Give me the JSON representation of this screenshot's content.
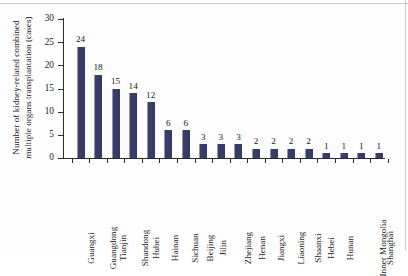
{
  "chart_data": {
    "type": "bar",
    "title": "",
    "xlabel": "",
    "ylabel": "Number of kidney-related combined multiple organs transplantation (cases)",
    "ylabel_line1": "Number of kidney-related combined",
    "ylabel_line2": "multiple organs transplantation (cases)",
    "ylim": [
      0,
      30
    ],
    "yticks": [
      0,
      5,
      10,
      15,
      20,
      25,
      30
    ],
    "ytick_labels": [
      "0",
      "5",
      "10",
      "15",
      "20",
      "25",
      "30"
    ],
    "grid": false,
    "legend": false,
    "bar_color": "#3a3f6b",
    "axis_color": "#2b2b2b",
    "categories": [
      "Guangxi",
      "Guangdong",
      "Tianjin",
      "Shandong",
      "Hubei",
      "Hainan",
      "Sichuan",
      "Beijing",
      "Jilin",
      "Zhejiang",
      "Henan",
      "Jiangxi",
      "Liaoning",
      "Shaanxi",
      "Hebei",
      "Hunan",
      "Inner Mongolia",
      "Shanghai"
    ],
    "values": [
      24,
      18,
      15,
      14,
      12,
      6,
      6,
      3,
      3,
      3,
      2,
      2,
      2,
      2,
      1,
      1,
      1,
      1
    ],
    "data_labels": [
      "24",
      "18",
      "15",
      "14",
      "12",
      "6",
      "6",
      "3",
      "3",
      "3",
      "2",
      "2",
      "2",
      "2",
      "1",
      "1",
      "1",
      "1"
    ]
  }
}
